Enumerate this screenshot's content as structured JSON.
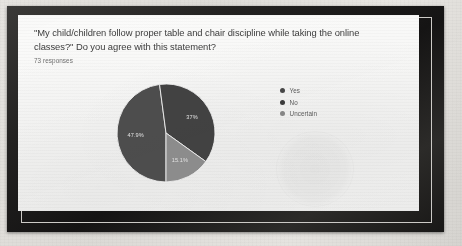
{
  "card": {
    "question": "\"My child/children follow proper table and chair discipline while taking the online classes?\" Do you agree with this statement?",
    "responses_label": "73 responses"
  },
  "chart_data": {
    "type": "pie",
    "title": "\"My child/children follow proper table and chair discipline while taking the online classes?\" Do you agree with this statement?",
    "subtitle": "73 responses",
    "legend_position": "right",
    "categories": [
      "Yes",
      "No",
      "Uncertain"
    ],
    "values": [
      47.9,
      37.0,
      15.1
    ],
    "value_labels": [
      "47.9%",
      "37%",
      "15.1%"
    ],
    "colors": [
      "#4a4a4a",
      "#3f3f3f",
      "#8e8e8e"
    ],
    "slices": [
      {
        "label": "Yes",
        "percent": 47.9,
        "display": "47.9%",
        "color": "#4a4a4a"
      },
      {
        "label": "No",
        "percent": 37.0,
        "display": "37%",
        "color": "#3f3f3f"
      },
      {
        "label": "Uncertain",
        "percent": 15.1,
        "display": "15.1%",
        "color": "#8e8e8e"
      }
    ],
    "total_responses": 73
  },
  "legend": {
    "items": [
      {
        "label": "Yes",
        "color": "#4a4a4a"
      },
      {
        "label": "No",
        "color": "#3f3f3f"
      },
      {
        "label": "Uncertain",
        "color": "#8e8e8e"
      }
    ]
  }
}
